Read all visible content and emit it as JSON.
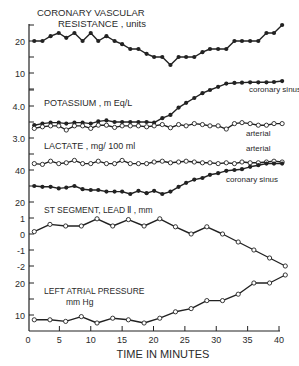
{
  "chart_data": {
    "type": "line",
    "xlabel": "TIME IN MINUTES",
    "x_ticks": [
      0,
      5,
      10,
      15,
      20,
      25,
      30,
      35,
      40
    ],
    "xlim": [
      0,
      40
    ],
    "panels": [
      {
        "id": "cvr",
        "title": "CORONARY VASCULAR",
        "title2": "RESISTANCE , units",
        "ylim": [
          5,
          25
        ],
        "y_ticks": [
          {
            "v": 10,
            "label": "10"
          },
          {
            "v": 20,
            "label": "20"
          }
        ],
        "minor_ticks": [
          5,
          15,
          25
        ],
        "series": [
          {
            "name": "Coronary vascular resistance",
            "marker": "filled",
            "x": [
              1,
              2.3,
              3.6,
              4.9,
              6.1,
              7.4,
              8.7,
              10,
              11.2,
              12.5,
              13.8,
              15,
              16.3,
              17.6,
              18.9,
              20.1,
              21.4,
              22.7,
              24,
              25.2,
              26.5,
              27.8,
              29,
              30.3,
              31.6,
              32.9,
              34.1,
              35.4,
              36.7,
              38,
              39.2,
              40.5
            ],
            "y": [
              20,
              20,
              21.5,
              22.5,
              21,
              22.5,
              20,
              22.5,
              20,
              21.5,
              20,
              19,
              17.5,
              17.5,
              16,
              15,
              15,
              12.5,
              15,
              15,
              15,
              16.5,
              17.5,
              17.5,
              17.5,
              20,
              20,
              20,
              20,
              22.5,
              22.5,
              25
            ]
          }
        ]
      },
      {
        "id": "potassium",
        "title": "POTASSIUM , m Eq/L",
        "ylim": [
          2.8,
          5.0
        ],
        "y_ticks": [
          {
            "v": 3.0,
            "label": "3.0"
          },
          {
            "v": 4.0,
            "label": "4.0"
          }
        ],
        "minor_ticks": [
          3.5,
          4.5
        ],
        "labels": [
          {
            "text": "coronary sinus",
            "x": 249,
            "y": 92
          },
          {
            "text": "arterial",
            "x": 246,
            "y": 136
          }
        ],
        "series": [
          {
            "name": "coronary sinus",
            "marker": "filled",
            "x": [
              1,
              2.3,
              3.6,
              4.9,
              6.1,
              7.4,
              8.7,
              10,
              11.2,
              12.5,
              13.8,
              15,
              16.3,
              17.6,
              18.9,
              20.1,
              21.4,
              22.7,
              24,
              25.2,
              26.5,
              27.8,
              29,
              30.3,
              31.6,
              32.9,
              34.1,
              35.4,
              36.7,
              38,
              39.2,
              40.5
            ],
            "y": [
              3.4,
              3.45,
              3.48,
              3.48,
              3.45,
              3.48,
              3.48,
              3.45,
              3.52,
              3.55,
              3.5,
              3.5,
              3.5,
              3.5,
              3.5,
              3.48,
              3.62,
              3.72,
              3.95,
              4.1,
              4.25,
              4.4,
              4.5,
              4.6,
              4.7,
              4.72,
              4.73,
              4.74,
              4.74,
              4.74,
              4.75,
              4.78
            ]
          },
          {
            "name": "arterial",
            "marker": "open",
            "x": [
              1,
              2.3,
              3.6,
              4.9,
              6.1,
              7.4,
              8.7,
              10,
              11.2,
              12.5,
              13.8,
              15,
              16.3,
              17.6,
              18.9,
              20.1,
              21.4,
              22.7,
              24,
              25.2,
              26.5,
              27.8,
              29,
              30.3,
              31.6,
              32.9,
              34.1,
              35.4,
              36.7,
              38,
              39.2,
              40.5
            ],
            "y": [
              3.3,
              3.35,
              3.38,
              3.38,
              3.25,
              3.38,
              3.38,
              3.3,
              3.4,
              3.4,
              3.33,
              3.38,
              3.38,
              3.38,
              3.35,
              3.38,
              3.42,
              3.32,
              3.42,
              3.38,
              3.45,
              3.42,
              3.38,
              3.38,
              3.28,
              3.45,
              3.48,
              3.45,
              3.4,
              3.4,
              3.45,
              3.45
            ]
          }
        ]
      },
      {
        "id": "lactate",
        "title": "LACTATE , mg/ 100 ml",
        "ylim": [
          18,
          50
        ],
        "y_ticks": [
          {
            "v": 20,
            "label": "20"
          },
          {
            "v": 40,
            "label": "40"
          }
        ],
        "minor_ticks": [
          30,
          50
        ],
        "labels": [
          {
            "text": "arterial",
            "x": 246,
            "y": 151
          },
          {
            "text": "coronary sinus",
            "x": 226,
            "y": 182
          }
        ],
        "series": [
          {
            "name": "arterial",
            "marker": "open",
            "x": [
              1,
              2.3,
              3.6,
              4.9,
              6.1,
              7.4,
              8.7,
              10,
              11.2,
              12.5,
              13.8,
              15,
              16.3,
              17.6,
              18.9,
              20.1,
              21.4,
              22.7,
              24,
              25.2,
              26.5,
              27.8,
              29,
              30.3,
              31.6,
              32.9,
              34.1,
              35.4,
              36.7,
              38,
              39.2,
              40.5
            ],
            "y": [
              44,
              43.5,
              45.5,
              44,
              44.5,
              46,
              44,
              44,
              45.5,
              44,
              44,
              46,
              44,
              44,
              44,
              45,
              45.5,
              44.5,
              45,
              45.5,
              45,
              44.5,
              44.5,
              44,
              44.5,
              44,
              45,
              44.5,
              44.5,
              45,
              45.5,
              45
            ]
          },
          {
            "name": "coronary sinus",
            "marker": "filled",
            "x": [
              1,
              2.3,
              3.6,
              4.9,
              6.1,
              7.4,
              8.7,
              10,
              11.2,
              12.5,
              13.8,
              15,
              16.3,
              17.6,
              18.9,
              20.1,
              21.4,
              22.7,
              24,
              25.2,
              26.5,
              27.8,
              29,
              30.3,
              31.6,
              32.9,
              34.1,
              35.4,
              36.7,
              38,
              39.2,
              40.5
            ],
            "y": [
              30,
              29.5,
              29.5,
              28.5,
              29,
              30,
              28,
              27.5,
              27.5,
              26.5,
              26.5,
              26.5,
              25,
              27,
              25.5,
              27,
              25,
              26.5,
              29.5,
              32,
              34,
              35,
              37,
              38,
              39.5,
              40,
              40.5,
              42,
              43,
              44,
              44,
              44
            ]
          }
        ]
      },
      {
        "id": "st_segment",
        "title": "ST   SEGMENT, LEAD Ⅱ , mm",
        "ylim": [
          -2.2,
          1.3
        ],
        "y_ticks": [
          {
            "v": 1,
            "label": "1"
          },
          {
            "v": 0,
            "label": "0"
          },
          {
            "v": -1,
            "label": "-1"
          },
          {
            "v": -2,
            "label": "-2"
          }
        ],
        "minor_ticks": [],
        "series": [
          {
            "name": "ST segment",
            "marker": "open",
            "x": [
              1,
              3.5,
              6,
              8.5,
              11,
              13.5,
              16,
              18.5,
              21,
              23.5,
              26,
              28.5,
              31,
              33.5,
              36,
              38.5,
              41
            ],
            "y": [
              0.15,
              0.6,
              0.5,
              0.5,
              0.95,
              0.5,
              0.9,
              0.5,
              0.95,
              0.45,
              0.0,
              0.45,
              0.0,
              -0.5,
              -1.0,
              -1.5,
              -2.0
            ]
          }
        ]
      },
      {
        "id": "lap",
        "title": "LEFT ATRIAL PRESSURE",
        "title2": "mm Hg",
        "ylim": [
          6,
          24
        ],
        "y_ticks": [
          {
            "v": 10,
            "label": "10"
          },
          {
            "v": 20,
            "label": "20"
          }
        ],
        "minor_ticks": [
          15
        ],
        "series": [
          {
            "name": "Left atrial pressure",
            "marker": "open",
            "x": [
              1,
              3.5,
              6,
              8.5,
              11,
              13.5,
              16,
              18.5,
              21,
              23.5,
              26,
              28.5,
              31,
              33.5,
              36,
              38.5,
              41
            ],
            "y": [
              8.5,
              8.5,
              8.0,
              9.5,
              7.5,
              9.0,
              8.5,
              7.5,
              9.0,
              11.0,
              12.0,
              14.5,
              14.5,
              16.5,
              20.0,
              20.0,
              22.5
            ]
          }
        ]
      }
    ]
  }
}
